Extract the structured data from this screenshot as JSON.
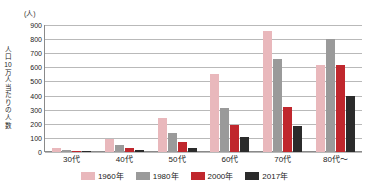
{
  "title": "",
  "unit_caption": "(人)",
  "y_axis_title": "人口10万人当たりの人数",
  "legend": {
    "items": [
      {
        "label": "1960年",
        "color": "#e9b8bc"
      },
      {
        "label": "1980年",
        "color": "#9a9a9a"
      },
      {
        "label": "2000年",
        "color": "#c0272d"
      },
      {
        "label": "2017年",
        "color": "#2b2b2b"
      }
    ]
  },
  "chart_data": {
    "type": "bar",
    "title": "",
    "xlabel": "",
    "ylabel": "人口10万人当たりの人数",
    "yunit": "(人)",
    "ylim": [
      0,
      900
    ],
    "ytick_step": 100,
    "yticks": [
      900,
      800,
      700,
      600,
      500,
      400,
      300,
      200,
      100,
      0
    ],
    "grid": true,
    "legend_position": "bottom",
    "categories": [
      "30代",
      "40代",
      "50代",
      "60代",
      "70代",
      "80代〜"
    ],
    "series": [
      {
        "name": "1960年",
        "color": "#e9b8bc",
        "values": [
          25,
          95,
          240,
          555,
          860,
          620
        ]
      },
      {
        "name": "1980年",
        "color": "#9a9a9a",
        "values": [
          15,
          50,
          135,
          310,
          660,
          800
        ]
      },
      {
        "name": "2000年",
        "color": "#c0272d",
        "values": [
          8,
          25,
          70,
          190,
          320,
          615
        ]
      },
      {
        "name": "2017年",
        "color": "#2b2b2b",
        "values": [
          3,
          12,
          25,
          105,
          185,
          395
        ]
      }
    ]
  }
}
